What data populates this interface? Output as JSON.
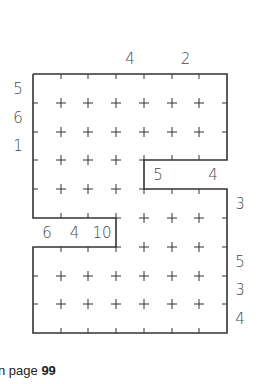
{
  "puzzle": {
    "columns": 7,
    "rows": 9,
    "grid": {
      "x_lines": [
        33,
        61,
        88,
        116,
        144,
        172,
        199,
        227
      ],
      "y_lines": [
        74,
        103,
        132,
        160,
        189,
        218,
        247,
        276,
        304,
        333
      ]
    },
    "outline": [
      [
        0,
        0
      ],
      [
        7,
        0
      ],
      [
        7,
        3
      ],
      [
        4,
        3
      ],
      [
        4,
        4
      ],
      [
        7,
        4
      ],
      [
        7,
        9
      ],
      [
        0,
        9
      ],
      [
        0,
        6
      ],
      [
        3,
        6
      ],
      [
        3,
        5
      ],
      [
        0,
        5
      ],
      [
        0,
        0
      ]
    ],
    "removed_cells": [
      {
        "row": 3,
        "cols": [
          4,
          5,
          6
        ]
      },
      {
        "row": 5,
        "cols": [
          0,
          1,
          2
        ]
      }
    ],
    "clues": {
      "top": [
        {
          "col": 3,
          "value": "4"
        },
        {
          "col": 5,
          "value": "2"
        }
      ],
      "left": [
        {
          "row": 0,
          "value": "5"
        },
        {
          "row": 1,
          "value": "6"
        },
        {
          "row": 2,
          "value": "1"
        }
      ],
      "right": [
        {
          "row": 4,
          "value": "3"
        },
        {
          "row": 6,
          "value": "5"
        },
        {
          "row": 7,
          "value": "3"
        },
        {
          "row": 8,
          "value": "4"
        }
      ],
      "upper_notch": [
        {
          "col": 4,
          "value": "5"
        },
        {
          "col": 6,
          "value": "4"
        }
      ],
      "lower_notch": [
        {
          "col": 0,
          "value": "6"
        },
        {
          "col": 1,
          "value": "4"
        },
        {
          "col": 2,
          "value": "10"
        }
      ]
    },
    "colors": {
      "line": "#333333",
      "text": "#4a4a4a"
    }
  },
  "footer": {
    "prefix": "n page ",
    "page_number": "99"
  }
}
